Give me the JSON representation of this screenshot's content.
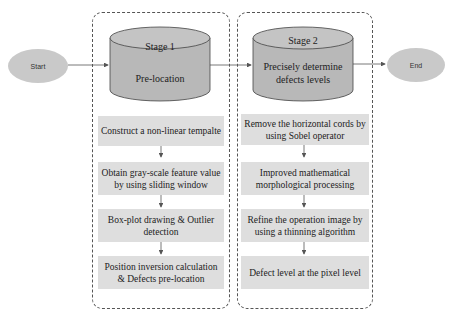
{
  "diagram": {
    "start": {
      "label": "Start"
    },
    "end": {
      "label": "End"
    },
    "stages": [
      {
        "title": "Stage 1",
        "subtitle": "Pre-location",
        "steps": [
          "Construct a non-linear tempalte",
          "Obtain gray-scale feature value by using sliding window",
          "Box-plot drawing & Outlier detection",
          "Position inversion calculation & Defects pre-location"
        ]
      },
      {
        "title": "Stage 2",
        "subtitle": "Precisely determine defects levels",
        "steps": [
          "Remove the horizontal cords by using Sobel operator",
          "Improved mathematical morphological processing",
          "Refine the operation image by using a thinning algorithm",
          "Defect level at the pixel level"
        ]
      }
    ],
    "colors": {
      "node_fill": "#c9c9c9",
      "step_fill": "#dedede",
      "line": "#555555"
    }
  }
}
